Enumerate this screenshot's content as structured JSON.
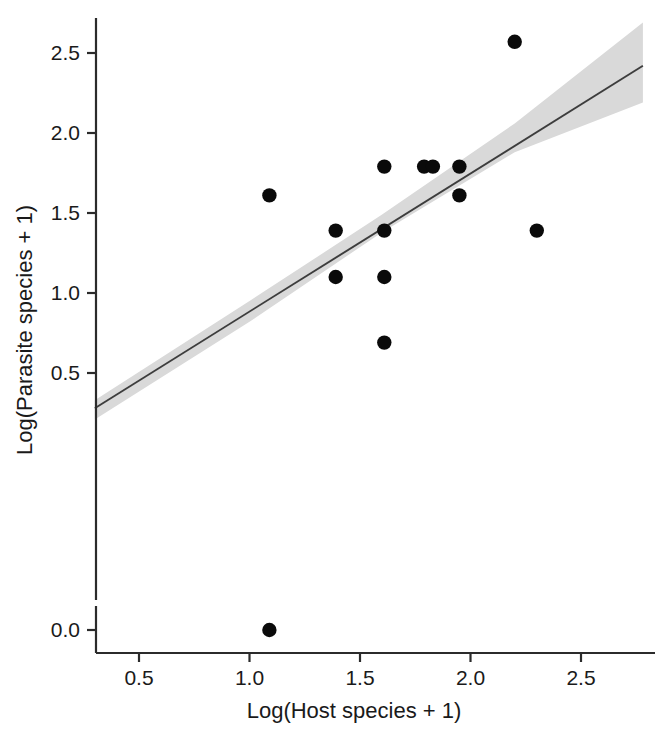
{
  "chart_data": {
    "type": "scatter",
    "title": "",
    "xlabel": "Log(Host species + 1)",
    "ylabel": "Log(Parasite species + 1)",
    "xlim": [
      0.3,
      2.78
    ],
    "ylim": [
      -0.06,
      2.7
    ],
    "grid": false,
    "legend": null,
    "xticks": [
      0.5,
      1.0,
      1.5,
      2.0,
      2.5
    ],
    "xtick_labels": [
      "0.5",
      "1.0",
      "1.5",
      "2.0",
      "2.5"
    ],
    "yticks": [
      0.0,
      0.5,
      1.0,
      1.5,
      2.0,
      2.5
    ],
    "ytick_labels": [
      "0.0",
      "0.5",
      "1.0",
      "1.5",
      "2.0",
      "2.5"
    ],
    "points": [
      {
        "x": 1.09,
        "y": 0.0
      },
      {
        "x": 1.09,
        "y": 1.61
      },
      {
        "x": 1.39,
        "y": 1.1
      },
      {
        "x": 1.39,
        "y": 1.39
      },
      {
        "x": 1.61,
        "y": 0.69
      },
      {
        "x": 1.61,
        "y": 1.1
      },
      {
        "x": 1.61,
        "y": 1.39
      },
      {
        "x": 1.61,
        "y": 1.79
      },
      {
        "x": 1.79,
        "y": 1.79
      },
      {
        "x": 1.83,
        "y": 1.79
      },
      {
        "x": 1.95,
        "y": 1.61
      },
      {
        "x": 1.95,
        "y": 1.79
      },
      {
        "x": 2.2,
        "y": 2.57
      },
      {
        "x": 2.3,
        "y": 1.39
      }
    ],
    "n_points": 14,
    "fit_line": {
      "type": "linear-regression",
      "x_start": 0.3,
      "y_start": 0.28,
      "x_end": 2.78,
      "y_end": 2.42
    },
    "confidence_band": {
      "label": "confidence interval",
      "color": "#d9d9d9",
      "upper": [
        {
          "x": 0.3,
          "y": 0.33
        },
        {
          "x": 1.0,
          "y": 0.95
        },
        {
          "x": 1.6,
          "y": 1.49
        },
        {
          "x": 2.2,
          "y": 2.06
        },
        {
          "x": 2.78,
          "y": 2.69
        }
      ],
      "lower": [
        {
          "x": 0.3,
          "y": 0.21
        },
        {
          "x": 1.0,
          "y": 0.82
        },
        {
          "x": 1.6,
          "y": 1.38
        },
        {
          "x": 2.2,
          "y": 1.88
        },
        {
          "x": 2.78,
          "y": 2.19
        }
      ]
    }
  },
  "axes": {
    "x_title": "Log(Host species + 1)",
    "y_title": "Log(Parasite species + 1)"
  }
}
